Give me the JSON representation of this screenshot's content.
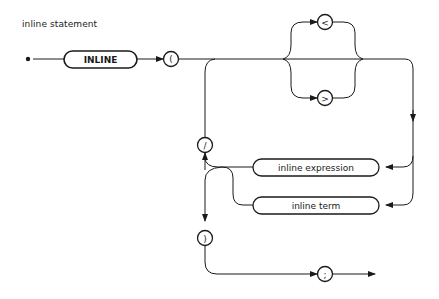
{
  "diagram": {
    "title": "inline statement",
    "nodes": {
      "keyword_inline": "INLINE",
      "open_paren": "(",
      "less_than": "<",
      "greater_than": ">",
      "slash": "/",
      "inline_expression": "inline expression",
      "inline_term": "inline term",
      "close_paren": ")",
      "semicolon": ";"
    },
    "colors": {
      "stroke": "#1a1a1a",
      "background": "#ffffff"
    }
  }
}
